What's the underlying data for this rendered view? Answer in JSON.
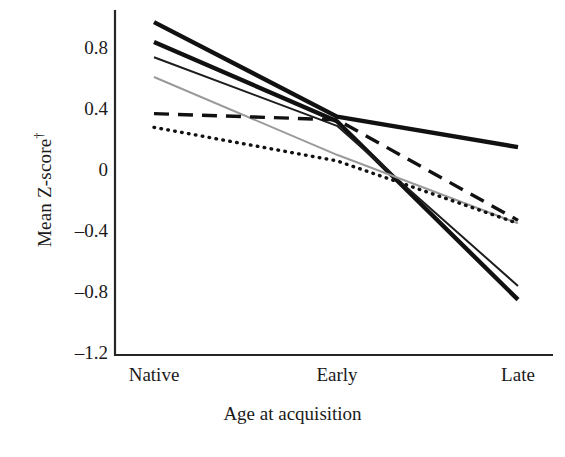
{
  "chart_data": {
    "type": "line",
    "title": "",
    "xlabel": "Age at acquisition",
    "ylabel": "Mean Z-score†",
    "categories": [
      "Native",
      "Early",
      "Late"
    ],
    "x": [
      0,
      1,
      2
    ],
    "ylim": [
      -1.2,
      1.0
    ],
    "yticks": [
      0.8,
      0.4,
      0,
      -0.4,
      -0.8,
      -1.2
    ],
    "ytick_labels": [
      "0.8",
      "0.4",
      "0",
      "–0.4",
      "–0.8",
      "–1.2"
    ],
    "grid": false,
    "legend": "none",
    "series": [
      {
        "name": "series-1",
        "style": "solid",
        "width": "thick",
        "color": "#111111",
        "values": [
          0.95,
          0.33,
          0.13
        ]
      },
      {
        "name": "series-2",
        "style": "solid",
        "width": "thick",
        "color": "#111111",
        "values": [
          0.82,
          0.3,
          -0.87
        ]
      },
      {
        "name": "series-3",
        "style": "solid",
        "width": "thin",
        "color": "#1d1d1d",
        "values": [
          0.72,
          0.27,
          -0.78
        ]
      },
      {
        "name": "series-4",
        "style": "solid",
        "width": "thin",
        "color": "#9a9a9a",
        "values": [
          0.59,
          0.08,
          -0.37
        ]
      },
      {
        "name": "series-5",
        "style": "dashed",
        "width": "medium",
        "color": "#111111",
        "values": [
          0.35,
          0.31,
          -0.35
        ]
      },
      {
        "name": "series-6",
        "style": "dotted",
        "width": "medium",
        "color": "#111111",
        "values": [
          0.26,
          0.04,
          -0.37
        ]
      }
    ]
  },
  "axes": {
    "y_title": "Mean Z-score",
    "y_title_dagger": "†",
    "x_title": "Age at acquisition",
    "y_tick_labels": [
      "0.8",
      "0.4",
      "0",
      "–0.4",
      "–0.8",
      "–1.2"
    ],
    "x_tick_labels": [
      "Native",
      "Early",
      "Late"
    ]
  }
}
